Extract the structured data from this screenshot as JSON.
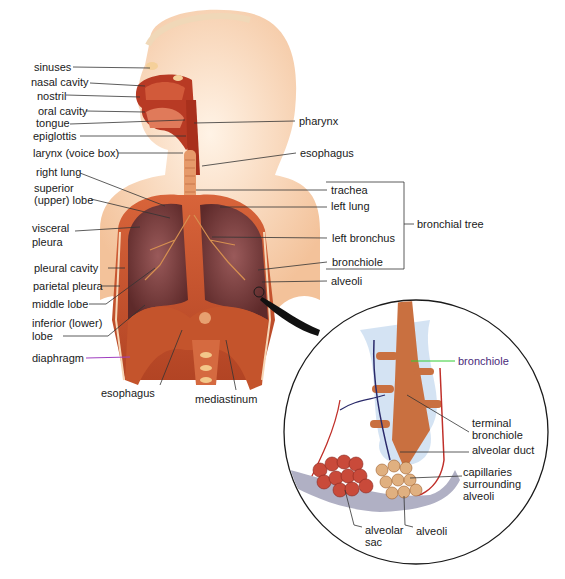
{
  "diagram": {
    "left_labels": [
      {
        "id": "sinuses",
        "text": "sinuses",
        "x": 34,
        "y": 61
      },
      {
        "id": "nasal-cavity",
        "text": "nasal cavity",
        "x": 31,
        "y": 74
      },
      {
        "id": "nostril",
        "text": "nostril",
        "x": 37,
        "y": 90
      },
      {
        "id": "oral-cavity",
        "text": "oral cavity",
        "x": 38,
        "y": 106
      },
      {
        "id": "tongue",
        "text": "tongue",
        "x": 36,
        "y": 118
      },
      {
        "id": "epiglottis",
        "text": "epiglottis",
        "x": 33,
        "y": 131
      },
      {
        "id": "larynx",
        "text": "larynx (voice box)",
        "x": 33,
        "y": 148
      },
      {
        "id": "right-lung",
        "text": "right lung",
        "x": 36,
        "y": 167
      },
      {
        "id": "superior-lobe-1",
        "text": "superior",
        "x": 34,
        "y": 183
      },
      {
        "id": "superior-lobe-2",
        "text": "(upper) lobe",
        "x": 34,
        "y": 195
      },
      {
        "id": "visceral-pleura-1",
        "text": "visceral",
        "x": 32,
        "y": 222
      },
      {
        "id": "visceral-pleura-2",
        "text": "pleura",
        "x": 32,
        "y": 237
      },
      {
        "id": "pleural-cavity",
        "text": "pleural cavity",
        "x": 34,
        "y": 262
      },
      {
        "id": "parietal-pleura",
        "text": "parietal pleura",
        "x": 33,
        "y": 281
      },
      {
        "id": "middle-lobe",
        "text": "middle lobe",
        "x": 32,
        "y": 299
      },
      {
        "id": "inferior-lobe-1",
        "text": "inferior (lower)",
        "x": 32,
        "y": 318
      },
      {
        "id": "inferior-lobe-2",
        "text": "lobe",
        "x": 32,
        "y": 331
      },
      {
        "id": "diaphragm",
        "text": "diaphragm",
        "x": 32,
        "y": 348
      }
    ],
    "right_labels": [
      {
        "id": "pharynx",
        "text": "pharynx",
        "x": 299,
        "y": 114
      },
      {
        "id": "esophagus-top",
        "text": "esophagus",
        "x": 300,
        "y": 146
      },
      {
        "id": "trachea",
        "text": "trachea",
        "x": 331,
        "y": 183
      },
      {
        "id": "left-lung",
        "text": "left lung",
        "x": 331,
        "y": 199
      },
      {
        "id": "left-bronchus",
        "text": "left bronchus",
        "x": 332,
        "y": 232
      },
      {
        "id": "bronchiole",
        "text": "bronchiole",
        "x": 332,
        "y": 256
      },
      {
        "id": "alveoli-main",
        "text": "alveoli",
        "x": 331,
        "y": 275
      }
    ],
    "bracket_label": {
      "text": "bronchial tree",
      "x": 417,
      "y": 218
    },
    "bottom_labels": [
      {
        "id": "esophagus-bottom",
        "text": "esophagus",
        "x": 101,
        "y": 386
      },
      {
        "id": "mediastinum",
        "text": "mediastinum",
        "x": 195,
        "y": 392
      }
    ],
    "inset_labels": [
      {
        "id": "inset-bronchiole",
        "text": "bronchiole",
        "x": 458,
        "y": 355
      },
      {
        "id": "terminal-bronchiole-1",
        "text": "terminal",
        "x": 472,
        "y": 417
      },
      {
        "id": "terminal-bronchiole-2",
        "text": "bronchiole",
        "x": 472,
        "y": 429
      },
      {
        "id": "alveolar-duct",
        "text": "alveolar duct",
        "x": 472,
        "y": 444
      },
      {
        "id": "capillaries-1",
        "text": "capillaries",
        "x": 463,
        "y": 466
      },
      {
        "id": "capillaries-2",
        "text": "surrounding",
        "x": 463,
        "y": 478
      },
      {
        "id": "capillaries-3",
        "text": "alveoli",
        "x": 463,
        "y": 490
      },
      {
        "id": "alveolar-sac-1",
        "text": "alveolar",
        "x": 365,
        "y": 525
      },
      {
        "id": "alveolar-sac-2",
        "text": "sac",
        "x": 365,
        "y": 537
      },
      {
        "id": "inset-alveoli",
        "text": "alveoli",
        "x": 416,
        "y": 526
      }
    ],
    "colors": {
      "skin": "#f7d2b0",
      "tissue": "#c8502e",
      "lung": "#7a3a3a",
      "inset_bg": "#c9dcf0",
      "alveoli": "#c96a3a",
      "capillary_red": "#c0302a",
      "vein_blue": "#2a2a6a",
      "bronchiole_pointer": "#33cc33",
      "diaphragm_pointer": "#a040c0"
    }
  }
}
